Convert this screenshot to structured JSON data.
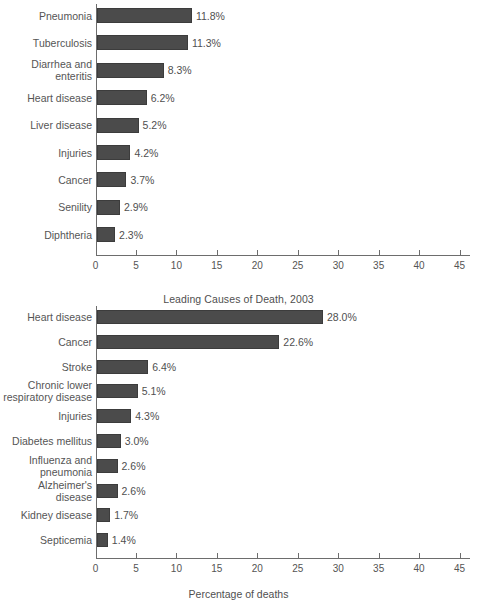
{
  "chart_data": [
    {
      "id": "top",
      "type": "bar",
      "orientation": "horizontal",
      "title": "",
      "xlabel": "",
      "ylabel": "",
      "xlim": [
        0,
        46
      ],
      "xticks": [
        0,
        5,
        10,
        15,
        20,
        25,
        30,
        35,
        40,
        45
      ],
      "xtick_labels": [
        "0",
        "5",
        "10",
        "15",
        "20",
        "25",
        "30",
        "35",
        "40",
        "45"
      ],
      "grid": false,
      "legend": false,
      "bar_color": "#4b4b4b",
      "categories": [
        "Pneumonia",
        "Tuberculosis",
        "Diarrhea and\nenteritis",
        "Heart disease",
        "Liver disease",
        "Injuries",
        "Cancer",
        "Senility",
        "Diphtheria"
      ],
      "values": [
        11.8,
        11.3,
        8.3,
        6.2,
        5.2,
        4.2,
        3.7,
        2.9,
        2.3
      ],
      "value_labels": [
        "11.8%",
        "11.3%",
        "8.3%",
        "6.2%",
        "5.2%",
        "4.2%",
        "3.7%",
        "2.9%",
        "2.3%"
      ]
    },
    {
      "id": "bottom",
      "type": "bar",
      "orientation": "horizontal",
      "title": "Leading Causes of Death, 2003",
      "xlabel": "Percentage of deaths",
      "ylabel": "",
      "xlim": [
        0,
        46
      ],
      "xticks": [
        0,
        5,
        10,
        15,
        20,
        25,
        30,
        35,
        40,
        45
      ],
      "xtick_labels": [
        "0",
        "5",
        "10",
        "15",
        "20",
        "25",
        "30",
        "35",
        "40",
        "45"
      ],
      "grid": false,
      "legend": false,
      "bar_color": "#4b4b4b",
      "categories": [
        "Heart disease",
        "Cancer",
        "Stroke",
        "Chronic lower\nrespiratory disease",
        "Injuries",
        "Diabetes mellitus",
        "Influenza and\npneumonia",
        "Alzheimer's\ndisease",
        "Kidney disease",
        "Septicemia"
      ],
      "values": [
        28.0,
        22.6,
        6.4,
        5.1,
        4.3,
        3.0,
        2.6,
        2.6,
        1.7,
        1.4
      ],
      "value_labels": [
        "28.0%",
        "22.6%",
        "6.4%",
        "5.1%",
        "4.3%",
        "3.0%",
        "2.6%",
        "2.6%",
        "1.7%",
        "1.4%"
      ]
    }
  ]
}
